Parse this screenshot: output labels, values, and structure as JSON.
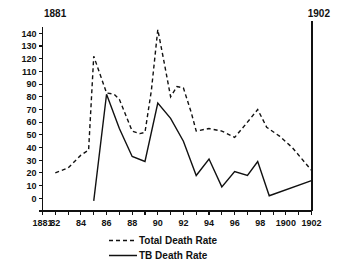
{
  "chart_data": {
    "type": "line",
    "title": "",
    "xlabel": "",
    "ylabel": "",
    "xlim": [
      1881,
      1902
    ],
    "ylim": [
      0,
      145
    ],
    "grid": false,
    "legend_position": "bottom",
    "x_tick_labels": [
      "1881",
      "82",
      "84",
      "86",
      "88",
      "90",
      "92",
      "94",
      "96",
      "98",
      "1900",
      "1902"
    ],
    "x_tick_values": [
      1881,
      1882,
      1884,
      1886,
      1888,
      1890,
      1892,
      1894,
      1896,
      1898,
      1900,
      1902
    ],
    "x_minor_tick_values": [
      1883,
      1885,
      1887,
      1889,
      1891,
      1893,
      1895,
      1897,
      1899,
      1901
    ],
    "y_tick_labels": [
      "140",
      "130",
      "120",
      "110",
      "90",
      "80",
      "70",
      "60",
      "50",
      "40",
      "30",
      "20",
      "10",
      "0"
    ],
    "y_tick_values": [
      140,
      130,
      120,
      110,
      100,
      90,
      80,
      70,
      60,
      50,
      40,
      30,
      20,
      10,
      0
    ],
    "corner_label_left": "1881",
    "corner_label_right": "1902",
    "series": [
      {
        "name": "Total Death Rate",
        "style": "dashed",
        "color": "#111111",
        "x": [
          1882,
          1883,
          1884,
          1884.6,
          1885,
          1886,
          1886.6,
          1887,
          1888,
          1888.6,
          1889,
          1889.5,
          1890,
          1890.5,
          1891,
          1891.5,
          1892,
          1892.6,
          1893,
          1894,
          1895,
          1896,
          1897,
          1897.8,
          1898.5,
          1899.5,
          1900.5,
          1902
        ],
        "values": [
          30,
          34,
          44,
          48,
          122,
          93,
          92,
          88,
          63,
          61,
          62,
          95,
          143,
          117,
          90,
          98,
          97,
          78,
          63,
          65,
          63,
          58,
          70,
          80,
          66,
          59,
          50,
          32
        ]
      },
      {
        "name": "TB Death Rate",
        "style": "solid",
        "color": "#111111",
        "x": [
          1885,
          1886,
          1887,
          1888,
          1889,
          1890,
          1891,
          1892,
          1893,
          1894,
          1895,
          1896,
          1897,
          1897.8,
          1898.7,
          1902
        ],
        "values": [
          8,
          92,
          65,
          43,
          39,
          85,
          73,
          55,
          28,
          41,
          19,
          31,
          28,
          39,
          12,
          24
        ]
      }
    ],
    "legend": [
      {
        "label": "Total Death Rate",
        "style": "dashed"
      },
      {
        "label": "TB   Death Rate",
        "style": "solid"
      }
    ]
  }
}
